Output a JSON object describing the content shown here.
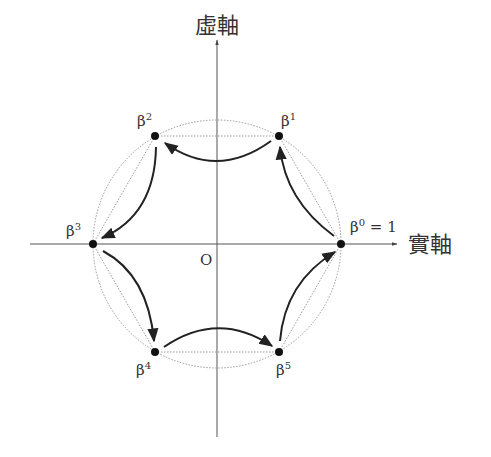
{
  "axes": {
    "imag_label": "虛軸",
    "real_label": "實軸",
    "origin_label": "O"
  },
  "points": [
    {
      "label": "β",
      "exp": "0",
      "suffix": " = 1",
      "x": 341,
      "y": 244
    },
    {
      "label": "β",
      "exp": "1",
      "suffix": "",
      "x": 279,
      "y": 136
    },
    {
      "label": "β",
      "exp": "2",
      "suffix": "",
      "x": 155,
      "y": 136
    },
    {
      "label": "β",
      "exp": "3",
      "suffix": "",
      "x": 93,
      "y": 244
    },
    {
      "label": "β",
      "exp": "4",
      "suffix": "",
      "x": 155,
      "y": 352
    },
    {
      "label": "β",
      "exp": "5",
      "suffix": "",
      "x": 279,
      "y": 352
    }
  ],
  "circle": {
    "cx": 217,
    "cy": 244,
    "r": 124
  },
  "colors": {
    "axis": "#555555",
    "dotted": "#9a9a9a",
    "arrow": "#222222",
    "dot": "#111111"
  }
}
